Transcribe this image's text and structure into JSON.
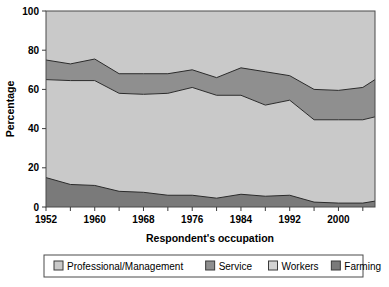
{
  "chart_data": {
    "type": "area",
    "title": "",
    "subtitle": "",
    "xlabel": "Respondent's occupation",
    "ylabel": "Percentage",
    "stacked": true,
    "grid": false,
    "legend_position": "bottom",
    "ylim": [
      0,
      100
    ],
    "xlim": [
      1952,
      2006
    ],
    "ytick_labels": [
      "0",
      "20",
      "40",
      "60",
      "80",
      "100"
    ],
    "ytick_values": [
      0,
      20,
      40,
      60,
      80,
      100
    ],
    "xtick_labels": [
      "1952",
      "1960",
      "1968",
      "1976",
      "1984",
      "1992",
      "2000"
    ],
    "xtick_values": [
      1952,
      1960,
      1968,
      1976,
      1984,
      1992,
      2000
    ],
    "x_minor_ticks": [
      1952,
      1956,
      1960,
      1964,
      1968,
      1972,
      1976,
      1980,
      1984,
      1988,
      1992,
      1996,
      2000,
      2004
    ],
    "x": [
      1952,
      1956,
      1960,
      1964,
      1968,
      1972,
      1976,
      1980,
      1984,
      1988,
      1992,
      1996,
      2000,
      2004,
      2006
    ],
    "series": [
      {
        "name": "Professional/Management",
        "color": "#c9c9c9",
        "cumulative_top": [
          100,
          100,
          100,
          100,
          100,
          100,
          100,
          100,
          100,
          100,
          100,
          100,
          100,
          100,
          100
        ],
        "values": [
          25,
          27,
          24.5,
          32,
          32,
          32,
          30,
          34,
          29,
          31,
          33,
          40,
          40.5,
          39,
          35
        ]
      },
      {
        "name": "Service",
        "color": "#8f8f8f",
        "cumulative_top": [
          75,
          73,
          75.5,
          68,
          68,
          68,
          70,
          66,
          71,
          69,
          67,
          60,
          59.5,
          61,
          65
        ],
        "values": [
          10,
          8.5,
          11,
          10,
          10.5,
          10,
          9,
          9,
          14,
          14,
          12.5,
          15.5,
          15,
          16.5,
          19
        ]
      },
      {
        "name": "Workers",
        "color": "#c9c9c9",
        "cumulative_top": [
          65,
          64.5,
          64.5,
          58,
          57.5,
          58,
          61,
          57,
          57,
          52,
          54.5,
          44.5,
          44.5,
          44.5,
          46
        ],
        "values": [
          50,
          53,
          53.5,
          50,
          50,
          52,
          55,
          53,
          50.5,
          46.5,
          48.5,
          42,
          42.5,
          42.5,
          43
        ]
      },
      {
        "name": "Farming",
        "color": "#7a7a7a",
        "cumulative_top": [
          15,
          11.5,
          11,
          8,
          7.5,
          6,
          6,
          4.5,
          6.5,
          5.5,
          6,
          2.5,
          2,
          2,
          3
        ],
        "values": [
          15,
          11.5,
          11,
          8,
          7.5,
          6,
          6,
          4.5,
          6.5,
          5.5,
          6,
          2.5,
          2,
          2,
          3
        ]
      }
    ],
    "boundaries": {
      "top_of_service": [
        75,
        73,
        75.5,
        68,
        68,
        68,
        70,
        66,
        71,
        69,
        67,
        60,
        59.5,
        61,
        65
      ],
      "top_of_workers": [
        65,
        64.5,
        64.5,
        58,
        57.5,
        58,
        61,
        57,
        57,
        52,
        54.5,
        44.5,
        44.5,
        44.5,
        46
      ],
      "top_of_farming": [
        15,
        11.5,
        11,
        8,
        7.5,
        6,
        6,
        4.5,
        6.5,
        5.5,
        6,
        2.5,
        2,
        2,
        3
      ]
    }
  },
  "legend": {
    "items": [
      {
        "label": "Professional/Management",
        "color": "#c9c9c9"
      },
      {
        "label": "Service",
        "color": "#8f8f8f"
      },
      {
        "label": "Workers",
        "color": "#d2d2d2"
      },
      {
        "label": "Farming",
        "color": "#7a7a7a"
      }
    ]
  },
  "axes": {
    "y_title": "Percentage",
    "x_title": "Respondent's occupation",
    "y_labels": [
      "100",
      "80",
      "60",
      "40",
      "20",
      "0"
    ],
    "x_labels": [
      "1952",
      "1960",
      "1968",
      "1976",
      "1984",
      "1992",
      "2000"
    ]
  },
  "colors": {
    "background": "#ffffff",
    "plot_border": "#4a4a4a",
    "line": "#2b2b2b",
    "band_light": "#c9c9c9",
    "band_mid": "#8f8f8f",
    "band_dark": "#7a7a7a"
  }
}
